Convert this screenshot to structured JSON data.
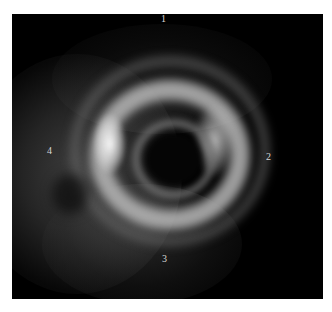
{
  "figure": {
    "background_color": "#000000",
    "ring_color": "#bfbfbf",
    "labels": [
      {
        "id": "1",
        "text": "1",
        "position": "top"
      },
      {
        "id": "2",
        "text": "2",
        "position": "right"
      },
      {
        "id": "3",
        "text": "3",
        "position": "bottom"
      },
      {
        "id": "4",
        "text": "4",
        "position": "left"
      }
    ]
  },
  "caption": {
    "text": ""
  }
}
